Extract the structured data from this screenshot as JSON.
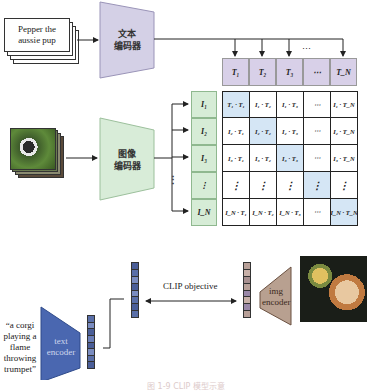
{
  "top_diagram": {
    "text_input": "Pepper the aussie pup",
    "text_encoder_label_line1": "文本",
    "text_encoder_label_line2": "编码器",
    "image_encoder_label_line1": "图像",
    "image_encoder_label_line2": "编码器",
    "text_features": [
      "T1",
      "T2",
      "T3",
      "…",
      "TN"
    ],
    "text_features_display": [
      "T₁",
      "T₂",
      "T₃",
      "⋯",
      "T_N"
    ],
    "text_arrows_ellipsis": "⋯",
    "image_features_display": [
      "I₁",
      "I₂",
      "I₃",
      "⋮",
      "I_N"
    ],
    "image_arrows_ellipsis": "⋮",
    "matrix": [
      [
        "T₁ · T₁",
        "I₁ · T₂",
        "I₁ · T₃",
        "⋯",
        "I₁ · T_N"
      ],
      [
        "I₂ · T₁",
        "I₂ · T₂",
        "I₂ · T₃",
        "⋯",
        "I₂ · T_N"
      ],
      [
        "I₃ · T₁",
        "I₃ · T₂",
        "I₃ · T₃",
        "⋯",
        "I₃ · T_N"
      ],
      [
        "⋮",
        "⋮",
        "⋮",
        "⋮",
        "⋮"
      ],
      [
        "I_N · T₁",
        "I_N · T₂",
        "I_N · T₃",
        "⋯",
        "I_N · T_N"
      ]
    ],
    "colors": {
      "text_encoder": "#d4d0e6",
      "image_encoder": "#d8ecd8",
      "diagonal": "#d5e6f5"
    }
  },
  "bottom_diagram": {
    "prompt_line1": "“a corgi",
    "prompt_line2": "playing a",
    "prompt_line3": "flame",
    "prompt_line4": "throwing",
    "prompt_line5": "trumpet”",
    "text_encoder_line1": "text",
    "text_encoder_line2": "encoder",
    "img_encoder_line1": "img",
    "img_encoder_line2": "encoder",
    "objective_label": "CLIP objective",
    "colors": {
      "text_encoder": "#4a67b0",
      "img_encoder": "#b8a090"
    }
  },
  "caption": "图 1-9  CLIP 模型示意"
}
